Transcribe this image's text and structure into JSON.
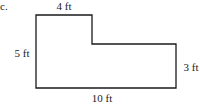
{
  "problem_label": "c.",
  "shape": {
    "type": "L-shaped polygon",
    "stroke_color": "#1a1a1a",
    "points": [
      [
        36,
        15
      ],
      [
        92,
        15
      ],
      [
        92,
        44
      ],
      [
        176,
        44
      ],
      [
        176,
        88
      ],
      [
        36,
        88
      ]
    ]
  },
  "dimensions": {
    "top": "4 ft",
    "left": "5 ft",
    "right": "3 ft",
    "bottom": "10 ft"
  }
}
